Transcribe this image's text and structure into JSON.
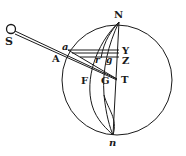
{
  "diagram": {
    "type": "geometric-figure",
    "colors": {
      "ink": "#1a1a1a",
      "background": "#ffffff"
    },
    "labels": {
      "S": "S",
      "N": "N",
      "n": "n",
      "a": "a",
      "A": "A",
      "Y": "Y",
      "Z": "Z",
      "T": "T",
      "F": "F",
      "G": "G",
      "r": "r",
      "g": "g"
    }
  }
}
